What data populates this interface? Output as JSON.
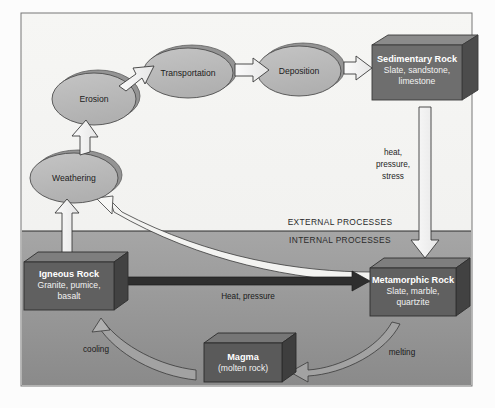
{
  "figure": {
    "frame": {
      "sky_color": "#f4f4f2",
      "ground_top_color": "#a0a0a0",
      "ground_bottom_color": "#8d8d8d",
      "border_color": "#6f6f6f"
    },
    "bands": [
      {
        "id": "external",
        "label": "EXTERNAL PROCESSES"
      },
      {
        "id": "internal",
        "label": "INTERNAL PROCESSES"
      }
    ],
    "ellipses": [
      {
        "id": "erosion",
        "label": "Erosion",
        "fill": "#b9b9b9",
        "shadow": "#8f8f8f"
      },
      {
        "id": "transportation",
        "label": "Transportation",
        "fill": "#b9b9b9",
        "shadow": "#8f8f8f"
      },
      {
        "id": "deposition",
        "label": "Deposition",
        "fill": "#b9b9b9",
        "shadow": "#8f8f8f"
      },
      {
        "id": "weathering",
        "label": "Weathering",
        "fill": "#b9b9b9",
        "shadow": "#8f8f8f"
      }
    ],
    "boxes": [
      {
        "id": "sedimentary",
        "title": "Sedimentary Rock",
        "line2": "Slate, sandstone,",
        "line3": "limestone",
        "fill": "#6e6e6e",
        "top_fill": "#8a8a8a",
        "side_fill": "#4f4f4f"
      },
      {
        "id": "igneous",
        "title": "Igneous Rock",
        "line2": "Granite, pumice,",
        "line3": "basalt",
        "fill": "#606060",
        "top_fill": "#7d7d7d",
        "side_fill": "#444444"
      },
      {
        "id": "metamorphic",
        "title": "Metamorphic Rock",
        "line2": "Slate, marble,",
        "line3": "quartzite",
        "fill": "#606060",
        "top_fill": "#7d7d7d",
        "side_fill": "#444444"
      },
      {
        "id": "magma",
        "title": "Magma",
        "line2": "(molten rock)",
        "line3": "",
        "fill": "#5a5a5a",
        "top_fill": "#767676",
        "side_fill": "#3e3e3e"
      }
    ],
    "edge_labels": [
      {
        "id": "heat-pressure-stress-1",
        "text": "heat,"
      },
      {
        "id": "heat-pressure-stress-2",
        "text": "pressure,"
      },
      {
        "id": "heat-pressure-stress-3",
        "text": "stress"
      },
      {
        "id": "heat-pressure",
        "text": "Heat, pressure"
      },
      {
        "id": "cooling",
        "text": "cooling"
      },
      {
        "id": "melting",
        "text": "melting"
      }
    ],
    "arrows": [
      {
        "id": "erosion-to-transportation",
        "style": "white-outline"
      },
      {
        "id": "transportation-to-deposition",
        "style": "white-outline"
      },
      {
        "id": "deposition-to-sedimentary",
        "style": "white-outline"
      },
      {
        "id": "sedimentary-to-metamorphic",
        "style": "white-outline"
      },
      {
        "id": "weathering-to-erosion",
        "style": "white-outline"
      },
      {
        "id": "igneous-to-weathering",
        "style": "white-outline"
      },
      {
        "id": "metamorphic-to-weathering",
        "style": "white-curved"
      },
      {
        "id": "igneous-to-metamorphic",
        "style": "dark-solid"
      },
      {
        "id": "metamorphic-to-magma",
        "style": "gray-curved"
      },
      {
        "id": "magma-to-igneous",
        "style": "gray-curved"
      }
    ]
  }
}
